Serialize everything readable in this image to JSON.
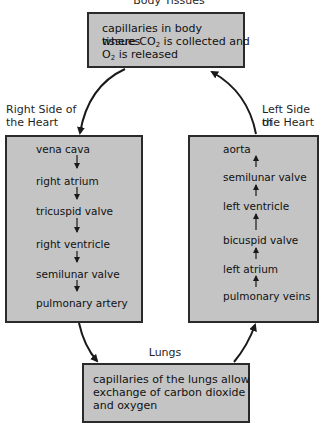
{
  "diagram": {
    "top": {
      "title": "Body Tissues",
      "line1": "capillaries in body tissues",
      "line2_pre": "where CO",
      "line2_sub": "2",
      "line2_post": " is collected and",
      "line3_pre": "O",
      "line3_sub": "2",
      "line3_post": " is released"
    },
    "left": {
      "title_line1": "Right Side of",
      "title_line2": "the Heart",
      "steps": [
        "vena cava",
        "right atrium",
        "tricuspid valve",
        "right ventricle",
        "semilunar valve",
        "pulmonary artery"
      ],
      "flow_direction": "down"
    },
    "right": {
      "title_line1": "Left Side of",
      "title_line2": "the Heart",
      "steps": [
        "aorta",
        "semilunar valve",
        "left ventricle",
        "bicuspid valve",
        "left atrium",
        "pulmonary veins"
      ],
      "flow_direction": "up"
    },
    "bottom": {
      "title": "Lungs",
      "line1": "capillaries of the lungs allow",
      "line2": "exchange of carbon dioxide",
      "line3": "and oxygen"
    },
    "colors": {
      "box_fill": "#c4c4c4",
      "box_border": "#2a2a2a",
      "arrow": "#1a1a1a"
    }
  }
}
